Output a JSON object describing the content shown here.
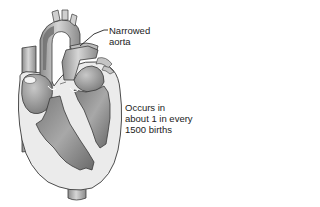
{
  "diagram": {
    "labels": {
      "narrowed_aorta": {
        "line1": "Narrowed",
        "line2": "aorta"
      },
      "incidence": {
        "line1": "Occurs in",
        "line2": "about 1 in every",
        "line3": "1500 births"
      }
    },
    "colors": {
      "outline": "#3a3a3a",
      "wall_light": "#e8e8e8",
      "chamber_mid": "#9a9a9a",
      "chamber_dark": "#6e6e6e",
      "vessel": "#bdbdbd",
      "text": "#222222"
    }
  }
}
